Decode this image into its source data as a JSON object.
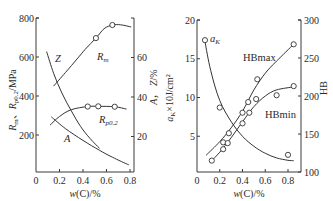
{
  "colors": {
    "line": "#333333",
    "axis": "#3a3a3a",
    "text": "#2a2a2a",
    "background": "#ffffff"
  },
  "chart_data": [
    {
      "type": "line",
      "title": "",
      "xlabel": "w(C)/%",
      "ylabel": "Rm、Rp0.2/MPa",
      "ylabel_right": "A，Z/%",
      "xlim": [
        0,
        0.85
      ],
      "ylim": [
        0,
        800
      ],
      "ylim_right": [
        0,
        80
      ],
      "x_ticks": [
        "0",
        "0.2",
        "0.4",
        "0.6",
        "0.8"
      ],
      "y_ticks": [
        "200",
        "400",
        "600",
        "800"
      ],
      "y_ticks_right": [
        "20",
        "40",
        "60"
      ],
      "grid": false,
      "legend": "inline curve labels",
      "series": [
        {
          "name": "Rm",
          "axis": "left",
          "label": "Rm",
          "curve": [
            [
              0.15,
              451
            ],
            [
              0.25,
              520
            ],
            [
              0.35,
              590
            ],
            [
              0.42,
              640
            ],
            [
              0.51,
              697
            ],
            [
              0.58,
              745
            ],
            [
              0.65,
              764
            ],
            [
              0.72,
              765
            ],
            [
              0.81,
              754
            ]
          ],
          "markers": [
            [
              0.51,
              697
            ],
            [
              0.65,
              764
            ]
          ]
        },
        {
          "name": "Rp0.2",
          "axis": "left",
          "label": "Rp0.2",
          "curve": [
            [
              0.12,
              251
            ],
            [
              0.2,
              295
            ],
            [
              0.3,
              330
            ],
            [
              0.44,
              346
            ],
            [
              0.53,
              347
            ],
            [
              0.67,
              345
            ],
            [
              0.77,
              333
            ]
          ],
          "markers": [
            [
              0.44,
              346
            ],
            [
              0.53,
              347
            ],
            [
              0.67,
              345
            ]
          ]
        },
        {
          "name": "Z",
          "axis": "right",
          "label": "Z",
          "curve": [
            [
              0.09,
              63
            ],
            [
              0.15,
              52
            ],
            [
              0.22,
              42
            ],
            [
              0.3,
              33
            ],
            [
              0.38,
              25
            ],
            [
              0.46,
              19
            ],
            [
              0.54,
              14
            ]
          ],
          "markers": []
        },
        {
          "name": "A",
          "axis": "right",
          "label": "A",
          "curve": [
            [
              0.13,
              30
            ],
            [
              0.25,
              24
            ],
            [
              0.4,
              18
            ],
            [
              0.54,
              13
            ],
            [
              0.65,
              9.5
            ],
            [
              0.79,
              5.6
            ]
          ],
          "markers": []
        }
      ]
    },
    {
      "type": "line",
      "title": "",
      "xlabel": "w(C)/%",
      "ylabel": "aK×10J/cm²",
      "ylabel_right": "HB",
      "xlim": [
        0,
        0.9
      ],
      "ylim": [
        0,
        20
      ],
      "ylim_right": [
        100,
        300
      ],
      "x_ticks": [
        "0",
        "0.2",
        "0.4",
        "0.6",
        "0.8"
      ],
      "y_ticks": [
        "5",
        "10",
        "15",
        "20"
      ],
      "y_ticks_right": [
        "100",
        "150",
        "200",
        "250",
        "300"
      ],
      "grid": false,
      "legend": "inline curve labels",
      "series": [
        {
          "name": "aK",
          "axis": "left",
          "label": "aK",
          "curve": [
            [
              0.07,
              17.2
            ],
            [
              0.12,
              13.5
            ],
            [
              0.2,
              9.6
            ],
            [
              0.3,
              6.9
            ],
            [
              0.4,
              5.0
            ],
            [
              0.5,
              3.7
            ],
            [
              0.6,
              2.8
            ],
            [
              0.7,
              2.2
            ],
            [
              0.8,
              1.9
            ],
            [
              0.85,
              1.85
            ]
          ],
          "markers": [
            [
              0.07,
              17.4
            ],
            [
              0.2,
              8.7
            ],
            [
              0.8,
              2.6
            ]
          ]
        },
        {
          "name": "HBmax",
          "axis": "right",
          "label": "HBmax",
          "curve": [
            [
              0.08,
              122
            ],
            [
              0.2,
              140
            ],
            [
              0.3,
              158
            ],
            [
              0.4,
              180
            ],
            [
              0.5,
              208
            ],
            [
              0.6,
              230
            ],
            [
              0.7,
              246
            ],
            [
              0.85,
              268
            ]
          ],
          "markers": [
            [
              0.23,
              139
            ],
            [
              0.28,
              151
            ],
            [
              0.4,
              178
            ],
            [
              0.45,
              192
            ],
            [
              0.53,
              222
            ],
            [
              0.85,
              268
            ]
          ]
        },
        {
          "name": "HBmin",
          "axis": "right",
          "label": "HBmin",
          "curve": [
            [
              0.13,
              115
            ],
            [
              0.2,
              126
            ],
            [
              0.3,
              145
            ],
            [
              0.4,
              166
            ],
            [
              0.5,
              186
            ],
            [
              0.6,
              200
            ],
            [
              0.7,
              208
            ],
            [
              0.85,
              212
            ]
          ],
          "markers": [
            [
              0.13,
              115
            ],
            [
              0.23,
              130
            ],
            [
              0.27,
              138
            ],
            [
              0.4,
              164
            ],
            [
              0.46,
              178
            ],
            [
              0.52,
              196
            ],
            [
              0.7,
              201
            ],
            [
              0.85,
              213
            ]
          ]
        }
      ]
    }
  ],
  "panels": [
    {
      "frame": {
        "x0": 36,
        "x1": 134,
        "y0": 172,
        "x_per_unit": 117.5,
        "y_top": 18,
        "y_zero": 174,
        "yr_top": 18,
        "yr_zero": 176
      },
      "labels": {
        "Rm": {
          "main": "R",
          "sub": "m",
          "x": 97,
          "y": 60
        },
        "Rp0.2": {
          "main": "R",
          "sub": "p0.2",
          "x": 99,
          "y": 123
        },
        "Z": {
          "main": "Z",
          "x": 55,
          "y": 62
        },
        "A": {
          "main": "A",
          "x": 64,
          "y": 142
        }
      },
      "ylabel_pos": {
        "x": 16,
        "y": 100
      },
      "ylabel_right_pos": {
        "x": 157,
        "y": 87
      }
    },
    {
      "frame": {
        "x0": 197,
        "x1": 301,
        "y0": 172,
        "x_per_unit": 113.75,
        "y_top": 20,
        "y_zero": 175,
        "yr_top": 20,
        "yr_zero": 172
      },
      "labels": {
        "aK": {
          "main": "a",
          "sub": "K",
          "x": 210,
          "y": 42
        },
        "HBmax": {
          "main": "HBmax",
          "x": 243,
          "y": 61
        },
        "HBmin": {
          "main": "HBmin",
          "x": 265,
          "y": 118
        }
      },
      "ylabel_pos": {
        "x": 173,
        "y": 98
      },
      "ylabel_right_pos": {
        "x": 327,
        "y": 88
      }
    }
  ]
}
